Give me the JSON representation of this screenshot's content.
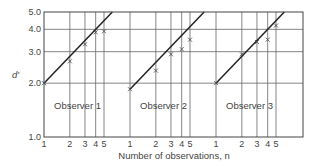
{
  "chart_data": {
    "type": "line",
    "title": "",
    "xlabel": "Number of observations, n",
    "ylabel": "d'",
    "yscale": "log",
    "ylim": [
      1.0,
      5.0
    ],
    "yticks": [
      "1.0",
      "2.0",
      "3.0",
      "4.0",
      "5.0"
    ],
    "xticks": [
      "1",
      "2",
      "3",
      "4",
      "5"
    ],
    "xscale": "log",
    "grid": true,
    "series": [
      {
        "name": "Observer 1",
        "x": [
          1,
          2,
          3,
          4,
          5
        ],
        "values": [
          2.0,
          2.65,
          3.3,
          3.85,
          3.9
        ],
        "fit_line": "d' = 2.0 * sqrt(n)"
      },
      {
        "name": "Observer 2",
        "x": [
          1,
          2,
          3,
          4,
          5
        ],
        "values": [
          1.85,
          2.35,
          2.9,
          3.1,
          3.5
        ],
        "fit_line": "d' = 1.85 * sqrt(n)"
      },
      {
        "name": "Observer 3",
        "x": [
          1,
          2,
          3,
          4,
          5
        ],
        "values": [
          2.0,
          2.9,
          3.4,
          3.5,
          4.2
        ],
        "fit_line": "d' = 2.0 * sqrt(n)"
      }
    ],
    "annotations": [
      "Observer 1",
      "Observer 2",
      "Observer 3"
    ]
  }
}
